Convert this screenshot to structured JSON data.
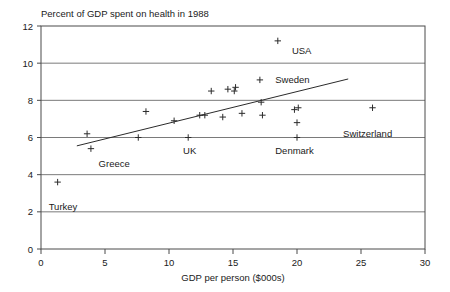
{
  "chart_data": {
    "type": "scatter",
    "title": "Percent of GDP spent on health in 1988",
    "xlabel": "GDP per person ($000s)",
    "ylabel": "",
    "xlim": [
      0,
      30
    ],
    "ylim": [
      0,
      12
    ],
    "xticks": [
      0,
      5,
      10,
      15,
      20,
      25,
      30
    ],
    "yticks": [
      0,
      2,
      4,
      6,
      8,
      10,
      12
    ],
    "xtick_labels": [
      "0",
      "5",
      "10",
      "15",
      "20",
      "25",
      "30"
    ],
    "ytick_labels": [
      "0",
      "2",
      "4",
      "6",
      "8",
      "10",
      "12"
    ],
    "grid": "horizontal",
    "legend": "none",
    "points": [
      {
        "x": 1.3,
        "y": 3.6
      },
      {
        "x": 3.6,
        "y": 6.2
      },
      {
        "x": 3.9,
        "y": 5.4
      },
      {
        "x": 7.6,
        "y": 6.0
      },
      {
        "x": 8.2,
        "y": 7.4
      },
      {
        "x": 10.4,
        "y": 6.9
      },
      {
        "x": 11.5,
        "y": 6.0
      },
      {
        "x": 12.4,
        "y": 7.2
      },
      {
        "x": 12.8,
        "y": 7.2
      },
      {
        "x": 13.3,
        "y": 8.5
      },
      {
        "x": 14.2,
        "y": 7.1
      },
      {
        "x": 14.6,
        "y": 8.6
      },
      {
        "x": 15.1,
        "y": 8.5
      },
      {
        "x": 15.2,
        "y": 8.7
      },
      {
        "x": 15.7,
        "y": 7.3
      },
      {
        "x": 17.1,
        "y": 9.1
      },
      {
        "x": 17.2,
        "y": 7.9
      },
      {
        "x": 17.3,
        "y": 7.2
      },
      {
        "x": 18.5,
        "y": 11.2
      },
      {
        "x": 19.8,
        "y": 7.5
      },
      {
        "x": 20.1,
        "y": 7.6
      },
      {
        "x": 20.0,
        "y": 6.8
      },
      {
        "x": 20.0,
        "y": 6.0
      },
      {
        "x": 25.9,
        "y": 7.6
      }
    ],
    "annotations": [
      {
        "label": "USA",
        "x": 19.6,
        "y": 10.7
      },
      {
        "label": "Sweden",
        "x": 18.3,
        "y": 9.1
      },
      {
        "label": "Switzerland",
        "x": 23.6,
        "y": 6.2
      },
      {
        "label": "Denmark",
        "x": 18.3,
        "y": 5.3
      },
      {
        "label": "UK",
        "x": 11.1,
        "y": 5.3
      },
      {
        "label": "Greece",
        "x": 4.5,
        "y": 4.6
      },
      {
        "label": "Turkey",
        "x": 0.6,
        "y": 2.3
      }
    ],
    "trend_line": {
      "x0": 2.8,
      "y0": 5.55,
      "x1": 24.0,
      "y1": 9.15
    }
  }
}
